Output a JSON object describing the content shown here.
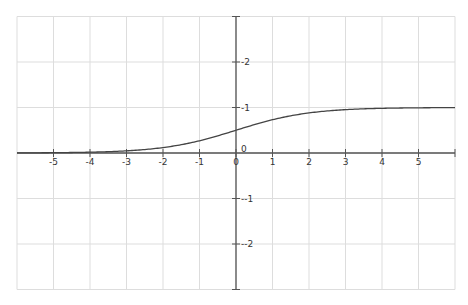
{
  "chart_data": {
    "type": "line",
    "title": "",
    "xlabel": "",
    "ylabel": "",
    "xlim": [
      -6,
      6
    ],
    "ylim": [
      -3,
      3
    ],
    "grid": true,
    "legend": null,
    "x_ticks": [
      -5,
      -4,
      -3,
      -2,
      -1,
      0,
      1,
      2,
      3,
      4,
      5
    ],
    "x_tick_labels": [
      "-5",
      "-4",
      "-3",
      "-2",
      "-1",
      "0",
      "1",
      "2",
      "3",
      "4",
      "5"
    ],
    "y_ticks": [
      -2,
      -1,
      0,
      1,
      2
    ],
    "y_tick_labels": [
      "-2",
      "-1",
      "0",
      "1",
      "2"
    ],
    "series": [
      {
        "name": "sigmoid",
        "function": "1/(1+e^(-x))",
        "x": [
          -6,
          -5,
          -4,
          -3,
          -2,
          -1,
          0,
          1,
          2,
          3,
          4,
          5,
          6
        ],
        "values": [
          0.002,
          0.007,
          0.018,
          0.047,
          0.119,
          0.269,
          0.5,
          0.731,
          0.881,
          0.953,
          0.982,
          0.993,
          0.998
        ]
      }
    ]
  },
  "style": {
    "grid_color": "#dddddd",
    "axis_color": "#555555",
    "curve_color": "#444444",
    "label_color": "#333333"
  },
  "layout": {
    "origin_px": [
      236,
      153
    ],
    "x_unit_px": 36.5,
    "y_unit_px": 45.5
  }
}
